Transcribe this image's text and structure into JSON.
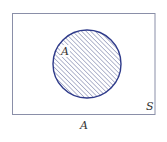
{
  "diagram": {
    "type": "venn",
    "universal_set": {
      "label": "S",
      "stroke": "#8a8fa8"
    },
    "set": {
      "label": "A",
      "shaded": true,
      "stroke": "#2e3a8a",
      "hatch": "#5a6496"
    },
    "caption": "A"
  }
}
